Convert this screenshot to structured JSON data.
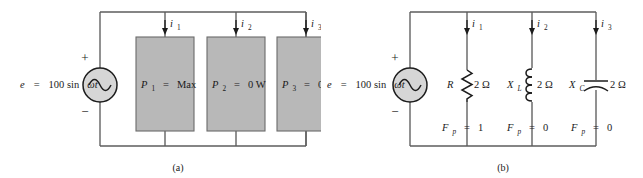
{
  "figure": {
    "colors": {
      "wire": "#5c5c5c",
      "component": "#1c1c1c",
      "block_fill": "#b8b8b8",
      "block_stroke": "#6b6b6b",
      "source_fill": "#d6d6d6",
      "background": "#ffffff"
    }
  },
  "panels": [
    {
      "id": "a",
      "caption": "(a)",
      "source": {
        "name": "ac-voltage-source",
        "label": "e  =  100 sin ωt",
        "label_parts": {
          "symbol": "e",
          "equals": "=",
          "value": "100 sin",
          "omega_t": "ωt"
        },
        "plus": "+",
        "minus": "−",
        "icon": "sine-wave-icon"
      },
      "branches": [
        {
          "current": {
            "label_base": "i",
            "label_sub": "1",
            "direction": "down",
            "icon": "down-arrow-icon"
          },
          "block": {
            "symbol_base": "P",
            "symbol_sub": "1",
            "equals": "=",
            "value": "Max"
          }
        },
        {
          "current": {
            "label_base": "i",
            "label_sub": "2",
            "direction": "down",
            "icon": "down-arrow-icon"
          },
          "block": {
            "symbol_base": "P",
            "symbol_sub": "2",
            "equals": "=",
            "value": "0 W"
          }
        },
        {
          "current": {
            "label_base": "i",
            "label_sub": "3",
            "direction": "down",
            "icon": "down-arrow-icon"
          },
          "block": {
            "symbol_base": "P",
            "symbol_sub": "3",
            "equals": "=",
            "value": "0 W"
          }
        }
      ]
    },
    {
      "id": "b",
      "caption": "(b)",
      "source": {
        "name": "ac-voltage-source",
        "label": "e  =  100 sin ωt",
        "label_parts": {
          "symbol": "e",
          "equals": "=",
          "value": "100 sin",
          "omega_t": "ωt"
        },
        "plus": "+",
        "minus": "−",
        "icon": "sine-wave-icon"
      },
      "branches": [
        {
          "current": {
            "label_base": "i",
            "label_sub": "1",
            "direction": "down",
            "icon": "down-arrow-icon"
          },
          "element": {
            "kind": "resistor",
            "icon": "resistor-icon",
            "symbol_base": "R",
            "symbol_sub": "",
            "value": "2 Ω"
          },
          "power_factor": {
            "symbol_base": "F",
            "symbol_sub": "p",
            "equals": "=",
            "value": "1"
          }
        },
        {
          "current": {
            "label_base": "i",
            "label_sub": "2",
            "direction": "down",
            "icon": "down-arrow-icon"
          },
          "element": {
            "kind": "inductor",
            "icon": "inductor-coil-icon",
            "symbol_base": "X",
            "symbol_sub": "L",
            "value": "2 Ω"
          },
          "power_factor": {
            "symbol_base": "F",
            "symbol_sub": "p",
            "equals": "=",
            "value": "0"
          }
        },
        {
          "current": {
            "label_base": "i",
            "label_sub": "3",
            "direction": "down",
            "icon": "down-arrow-icon"
          },
          "element": {
            "kind": "capacitor",
            "icon": "capacitor-curved-icon",
            "symbol_base": "X",
            "symbol_sub": "C",
            "value": "2 Ω"
          },
          "power_factor": {
            "symbol_base": "F",
            "symbol_sub": "p",
            "equals": "=",
            "value": "0"
          }
        }
      ]
    }
  ]
}
